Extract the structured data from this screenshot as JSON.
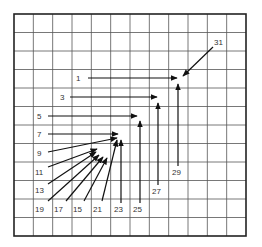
{
  "diagram": {
    "grid": {
      "left": 14,
      "top": 14,
      "right": 246,
      "bottom": 236,
      "cols": 12,
      "rows": 12,
      "line_color": "#555555",
      "border_color": "#222222"
    },
    "arrow_color": "#111111",
    "arrows": [
      {
        "label": "1",
        "lx": 76,
        "ly": 81,
        "x1": 88,
        "y1": 78,
        "x2": 177,
        "y2": 78
      },
      {
        "label": "3",
        "lx": 60,
        "ly": 100,
        "x1": 70,
        "y1": 97,
        "x2": 157,
        "y2": 97
      },
      {
        "label": "5",
        "lx": 37,
        "ly": 119,
        "x1": 48,
        "y1": 116,
        "x2": 137,
        "y2": 116
      },
      {
        "label": "7",
        "lx": 37,
        "ly": 137,
        "x1": 48,
        "y1": 134,
        "x2": 118,
        "y2": 134
      },
      {
        "label": "9",
        "lx": 37,
        "ly": 156,
        "x1": 48,
        "y1": 152,
        "x2": 117,
        "y2": 138
      },
      {
        "label": "11",
        "lx": 35,
        "ly": 175,
        "x1": 48,
        "y1": 167,
        "x2": 97,
        "y2": 149
      },
      {
        "label": "13",
        "lx": 35,
        "ly": 193,
        "x1": 48,
        "y1": 184,
        "x2": 96,
        "y2": 152
      },
      {
        "label": "19",
        "lx": 35,
        "ly": 212,
        "x1": 48,
        "y1": 201,
        "x2": 99,
        "y2": 155
      },
      {
        "label": "17",
        "lx": 54,
        "ly": 212,
        "x1": 66,
        "y1": 201,
        "x2": 103,
        "y2": 157
      },
      {
        "label": "15",
        "lx": 73,
        "ly": 212,
        "x1": 84,
        "y1": 201,
        "x2": 107,
        "y2": 158
      },
      {
        "label": "21",
        "lx": 93,
        "ly": 212,
        "x1": 102,
        "y1": 201,
        "x2": 117,
        "y2": 140
      },
      {
        "label": "23",
        "lx": 114,
        "ly": 212,
        "x1": 121,
        "y1": 203,
        "x2": 121,
        "y2": 140
      },
      {
        "label": "25",
        "lx": 133,
        "ly": 212,
        "x1": 140,
        "y1": 203,
        "x2": 140,
        "y2": 121
      },
      {
        "label": "27",
        "lx": 152,
        "ly": 194,
        "x1": 158,
        "y1": 185,
        "x2": 158,
        "y2": 103
      },
      {
        "label": "29",
        "lx": 172,
        "ly": 175,
        "x1": 178,
        "y1": 166,
        "x2": 178,
        "y2": 84
      },
      {
        "label": "31",
        "lx": 214,
        "ly": 45,
        "x1": 213,
        "y1": 47,
        "x2": 183,
        "y2": 76
      }
    ]
  }
}
